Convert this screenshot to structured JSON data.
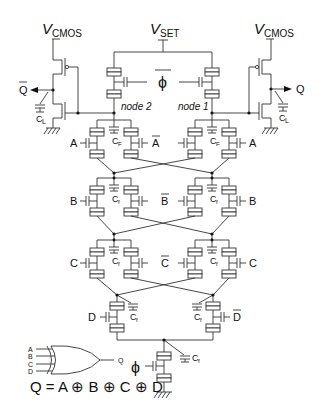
{
  "labels": {
    "vcmos_left": "V",
    "vcmos_left_sub": "CMOS",
    "vset": "V",
    "vset_sub": "SET",
    "vcmos_right": "V",
    "vcmos_right_sub": "CMOS",
    "phi_top": "ϕ",
    "phi_bottom": "ϕ",
    "node1": "node 1",
    "node2": "node 2",
    "qbar": "Q",
    "q": "Q",
    "cl_left": "C",
    "cl_left_sub": "L",
    "cl_right": "C",
    "cl_right_sub": "L",
    "cf": "C",
    "cf_sub": "F",
    "cf_small": "f",
    "a": "A",
    "abar": "A",
    "b": "B",
    "bbar": "B",
    "c": "C",
    "cbar": "C",
    "d": "D",
    "dbar": "D",
    "gate_inputs": [
      "A",
      "B",
      "C",
      "D"
    ],
    "gate_output": "Q",
    "equation": "Q = A ⊕ B ⊕ C ⊕ D"
  }
}
